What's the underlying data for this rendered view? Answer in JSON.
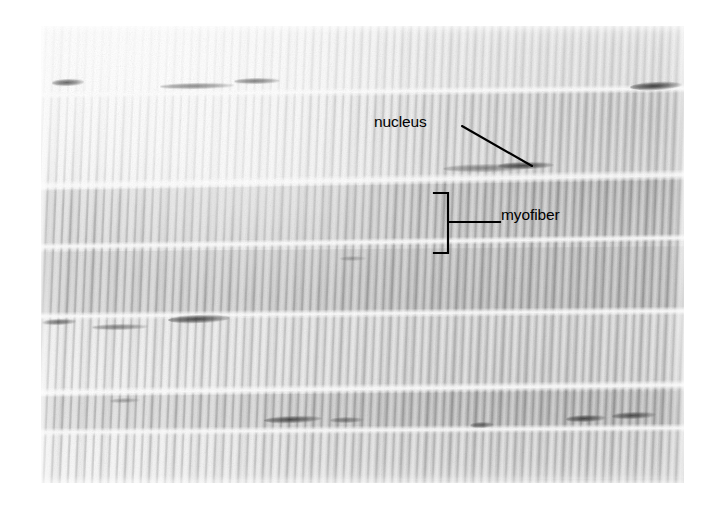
{
  "figure": {
    "domain": "light-micrograph",
    "background_color": "#ffffff",
    "plate": {
      "x": 41,
      "y": 26,
      "width": 643,
      "height": 457,
      "tone_light": "#ececec",
      "tone_mid": "#d2d2d2",
      "tone_dark": "#b4b4b4"
    }
  },
  "annotations": {
    "nucleus": {
      "label": "nucleus",
      "x": 374,
      "y": 114,
      "leader": {
        "type": "arrow",
        "x1": 462,
        "y1": 126,
        "x2": 532,
        "y2": 166
      },
      "color": "#000000"
    },
    "myofiber": {
      "label": "myofiber",
      "x": 501,
      "y": 207,
      "leader": {
        "type": "bracket-line",
        "x1": 449,
        "y1": 222,
        "x2": 500,
        "y2": 222
      },
      "bracket": {
        "x": 448,
        "y_top": 193,
        "y_bottom": 253,
        "tick_length": 14
      },
      "color": "#000000"
    }
  },
  "structures": {
    "fiber_gaps": [
      {
        "y": 95,
        "height": 9,
        "tilt": -0.6
      },
      {
        "y": 186,
        "height": 11,
        "tilt": -1.0
      },
      {
        "y": 247,
        "height": 8,
        "tilt": -0.8
      },
      {
        "y": 316,
        "height": 9,
        "tilt": -0.5
      },
      {
        "y": 393,
        "height": 10,
        "tilt": -0.7
      },
      {
        "y": 432,
        "height": 9,
        "tilt": -0.4
      }
    ],
    "fiber_bands": [
      {
        "y": 26,
        "height": 70,
        "tilt": -0.6,
        "shade": "rgba(255,255,255,0.55)"
      },
      {
        "y": 100,
        "height": 86,
        "tilt": -1.0,
        "shade": "rgba(255,255,255,0.30)"
      },
      {
        "y": 190,
        "height": 58,
        "tilt": -0.8,
        "shade": "rgba(120,120,120,0.10)"
      },
      {
        "y": 252,
        "height": 64,
        "tilt": -0.5,
        "shade": "rgba(110,110,110,0.13)"
      },
      {
        "y": 320,
        "height": 74,
        "tilt": -0.7,
        "shade": "rgba(255,255,255,0.22)"
      },
      {
        "y": 396,
        "height": 38,
        "tilt": -0.4,
        "shade": "rgba(120,120,120,0.12)"
      },
      {
        "y": 436,
        "height": 47,
        "tilt": -0.4,
        "shade": "rgba(255,255,255,0.18)"
      }
    ],
    "nuclei": [
      {
        "x": 52,
        "y": 82,
        "w": 32,
        "h": 7,
        "tilt": -2,
        "opacity": 0.75
      },
      {
        "x": 160,
        "y": 86,
        "w": 74,
        "h": 6,
        "tilt": -1,
        "opacity": 0.55
      },
      {
        "x": 234,
        "y": 81,
        "w": 46,
        "h": 6,
        "tilt": -1,
        "opacity": 0.6
      },
      {
        "x": 630,
        "y": 86,
        "w": 52,
        "h": 8,
        "tilt": -3,
        "opacity": 0.95
      },
      {
        "x": 443,
        "y": 168,
        "w": 88,
        "h": 8,
        "tilt": -1,
        "opacity": 0.5
      },
      {
        "x": 498,
        "y": 165,
        "w": 56,
        "h": 7,
        "tilt": -1,
        "opacity": 0.85
      },
      {
        "x": 42,
        "y": 322,
        "w": 34,
        "h": 6,
        "tilt": -2,
        "opacity": 0.7
      },
      {
        "x": 92,
        "y": 327,
        "w": 56,
        "h": 6,
        "tilt": -1,
        "opacity": 0.55
      },
      {
        "x": 168,
        "y": 319,
        "w": 62,
        "h": 8,
        "tilt": -2,
        "opacity": 0.88
      },
      {
        "x": 264,
        "y": 419,
        "w": 58,
        "h": 7,
        "tilt": -2,
        "opacity": 0.82
      },
      {
        "x": 330,
        "y": 420,
        "w": 34,
        "h": 6,
        "tilt": -1,
        "opacity": 0.55
      },
      {
        "x": 470,
        "y": 425,
        "w": 24,
        "h": 6,
        "tilt": -2,
        "opacity": 0.7
      },
      {
        "x": 566,
        "y": 418,
        "w": 40,
        "h": 7,
        "tilt": -2,
        "opacity": 0.85
      },
      {
        "x": 612,
        "y": 415,
        "w": 44,
        "h": 7,
        "tilt": -2,
        "opacity": 0.8
      },
      {
        "x": 110,
        "y": 400,
        "w": 30,
        "h": 5,
        "tilt": -2,
        "opacity": 0.35
      },
      {
        "x": 340,
        "y": 258,
        "w": 26,
        "h": 5,
        "tilt": -1,
        "opacity": 0.3
      }
    ]
  }
}
